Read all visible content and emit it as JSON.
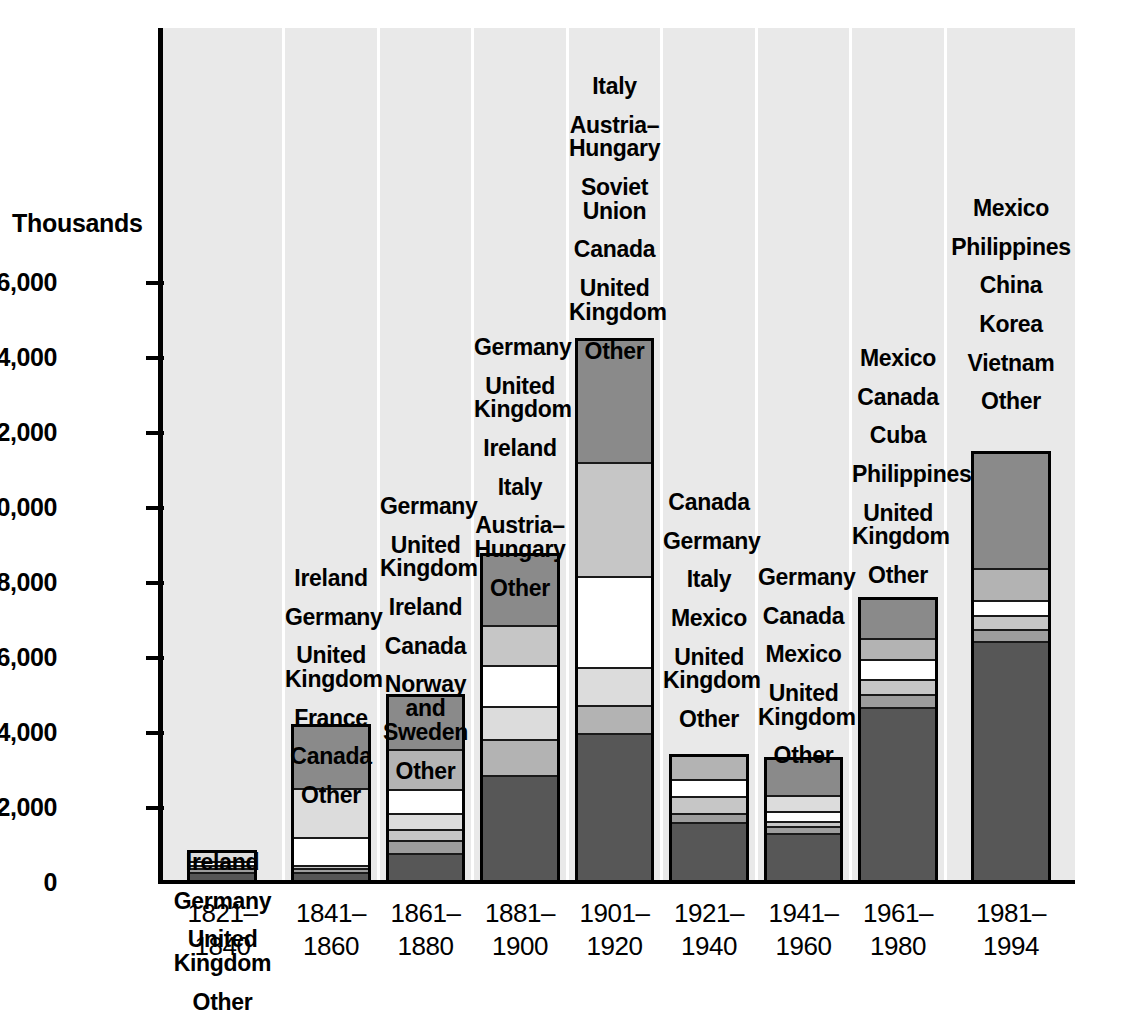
{
  "chart_data": {
    "type": "bar",
    "stacked": true,
    "title": "",
    "xlabel": "",
    "ylabel": "Thousands",
    "ylim": [
      0,
      17500
    ],
    "yticks": [
      0,
      2000,
      4000,
      6000,
      8000,
      10000,
      12000,
      14000,
      16000
    ],
    "ytick_labels": [
      "0",
      "2,000",
      "4,000",
      "6,000",
      "8,000",
      "10,000",
      "12,000",
      "14,000",
      "16,000"
    ],
    "grid": false,
    "legend": "in-panel stack labels above each bar",
    "categories": [
      "1821-\n1840",
      "1841-\n1860",
      "1861-\n1880",
      "1881-\n1900",
      "1901-\n1920",
      "1921-\n1940",
      "1941-\n1960",
      "1961-\n1980",
      "1981-\n1994"
    ],
    "bars": [
      {
        "period": "1821-1840",
        "total": 870,
        "labels": [
          "Ireland",
          "Germany",
          "United Kingdom",
          "Other"
        ],
        "segments": [
          {
            "name": "Other",
            "value": 300,
            "tone": "f-dark"
          },
          {
            "name": "United Kingdom",
            "value": 90,
            "tone": "f-mid"
          },
          {
            "name": "Germany",
            "value": 80,
            "tone": "f-light"
          },
          {
            "name": "Ireland",
            "value": 110,
            "tone": "f-white"
          },
          {
            "name": "Ireland-upper",
            "value": 290,
            "tone": "f-pale"
          }
        ]
      },
      {
        "period": "1841-1860",
        "total": 4240,
        "labels": [
          "Ireland",
          "Germany",
          "United Kingdom",
          "France",
          "Canada",
          "Other"
        ],
        "segments": [
          {
            "name": "Other",
            "value": 300,
            "tone": "f-dark"
          },
          {
            "name": "Canada",
            "value": 100,
            "tone": "f-mid"
          },
          {
            "name": "France",
            "value": 80,
            "tone": "f-light"
          },
          {
            "name": "United Kingdom",
            "value": 740,
            "tone": "f-white"
          },
          {
            "name": "Germany",
            "value": 1310,
            "tone": "f-pale"
          },
          {
            "name": "Ireland",
            "value": 1710,
            "tone": "f-gray"
          }
        ]
      },
      {
        "period": "1861-1880",
        "total": 5030,
        "labels": [
          "Germany",
          "United Kingdom",
          "Ireland",
          "Canada",
          "Norway and Sweden",
          "Other"
        ],
        "segments": [
          {
            "name": "Other",
            "value": 810,
            "tone": "f-dark"
          },
          {
            "name": "Norway and Sweden",
            "value": 350,
            "tone": "f-mid"
          },
          {
            "name": "Canada",
            "value": 280,
            "tone": "f-light"
          },
          {
            "name": "Ireland",
            "value": 440,
            "tone": "f-pale"
          },
          {
            "name": "United Kingdom",
            "value": 620,
            "tone": "f-white"
          },
          {
            "name": "Germany",
            "value": 1070,
            "tone": "f-lgray"
          },
          {
            "name": "Germany-upper",
            "value": 1460,
            "tone": "f-gray"
          }
        ]
      },
      {
        "period": "1881-1900",
        "total": 8790,
        "labels": [
          "Germany",
          "United Kingdom",
          "Ireland",
          "Italy",
          "Austria-Hungary",
          "Other"
        ],
        "segments": [
          {
            "name": "Other",
            "value": 2880,
            "tone": "f-dark"
          },
          {
            "name": "Austria-Hungary",
            "value": 950,
            "tone": "f-lgray"
          },
          {
            "name": "Italy",
            "value": 900,
            "tone": "f-pale"
          },
          {
            "name": "Ireland",
            "value": 1080,
            "tone": "f-white"
          },
          {
            "name": "United Kingdom",
            "value": 1080,
            "tone": "f-light"
          },
          {
            "name": "Germany",
            "value": 1900,
            "tone": "f-gray"
          }
        ]
      },
      {
        "period": "1901-1920",
        "total": 14530,
        "labels": [
          "Italy",
          "Austria-Hungary",
          "Soviet Union",
          "Canada",
          "United Kingdom",
          "Other"
        ],
        "segments": [
          {
            "name": "Other",
            "value": 3990,
            "tone": "f-dark"
          },
          {
            "name": "United Kingdom",
            "value": 760,
            "tone": "f-lgray"
          },
          {
            "name": "Canada",
            "value": 1000,
            "tone": "f-pale"
          },
          {
            "name": "Soviet Union",
            "value": 2430,
            "tone": "f-white"
          },
          {
            "name": "Austria-Hungary",
            "value": 3060,
            "tone": "f-light"
          },
          {
            "name": "Italy",
            "value": 3290,
            "tone": "f-gray"
          }
        ]
      },
      {
        "period": "1921-1940",
        "total": 3450,
        "labels": [
          "Canada",
          "Germany",
          "Italy",
          "Mexico",
          "United Kingdom",
          "Other"
        ],
        "segments": [
          {
            "name": "Other",
            "value": 1620,
            "tone": "f-dark"
          },
          {
            "name": "United Kingdom",
            "value": 240,
            "tone": "f-mid"
          },
          {
            "name": "Mexico",
            "value": 470,
            "tone": "f-light"
          },
          {
            "name": "Italy",
            "value": 440,
            "tone": "f-white"
          },
          {
            "name": "Germany",
            "value": 680,
            "tone": "f-lgray"
          }
        ]
      },
      {
        "period": "1941-1960",
        "total": 3360,
        "labels": [
          "Germany",
          "Canada",
          "Mexico",
          "United Kingdom",
          "Other"
        ],
        "segments": [
          {
            "name": "Other",
            "value": 1330,
            "tone": "f-dark"
          },
          {
            "name": "United Kingdom",
            "value": 200,
            "tone": "f-mid"
          },
          {
            "name": "Mexico",
            "value": 130,
            "tone": "f-light"
          },
          {
            "name": "Canada",
            "value": 270,
            "tone": "f-white"
          },
          {
            "name": "Germany-a",
            "value": 430,
            "tone": "f-pale"
          },
          {
            "name": "Germany",
            "value": 1000,
            "tone": "f-gray"
          }
        ]
      },
      {
        "period": "1961-1980",
        "total": 7620,
        "labels": [
          "Mexico",
          "Canada",
          "Cuba",
          "Philippines",
          "United Kingdom",
          "Other"
        ],
        "segments": [
          {
            "name": "Other",
            "value": 4700,
            "tone": "f-dark"
          },
          {
            "name": "United Kingdom",
            "value": 330,
            "tone": "f-mid"
          },
          {
            "name": "Philippines",
            "value": 410,
            "tone": "f-light"
          },
          {
            "name": "Cuba",
            "value": 530,
            "tone": "f-white"
          },
          {
            "name": "Canada",
            "value": 560,
            "tone": "f-lgray"
          },
          {
            "name": "Mexico",
            "value": 1090,
            "tone": "f-gray"
          }
        ]
      },
      {
        "period": "1981-1994",
        "total": 11520,
        "labels": [
          "Mexico",
          "Philippines",
          "China",
          "Korea",
          "Vietnam",
          "Other"
        ],
        "segments": [
          {
            "name": "Other",
            "value": 6450,
            "tone": "f-dark"
          },
          {
            "name": "Vietnam",
            "value": 320,
            "tone": "f-mid"
          },
          {
            "name": "Korea",
            "value": 380,
            "tone": "f-light"
          },
          {
            "name": "China",
            "value": 390,
            "tone": "f-white"
          },
          {
            "name": "Philippines",
            "value": 850,
            "tone": "f-lgray"
          },
          {
            "name": "Mexico",
            "value": 3130,
            "tone": "f-gray"
          }
        ]
      }
    ]
  },
  "axis": {
    "y_title": "Thousands",
    "ticks": [
      {
        "value": 16000,
        "label": "16,000"
      },
      {
        "value": 14000,
        "label": "14,000"
      },
      {
        "value": 12000,
        "label": "12,000"
      },
      {
        "value": 10000,
        "label": "10,000"
      },
      {
        "value": 8000,
        "label": "8,000"
      },
      {
        "value": 6000,
        "label": "6,000"
      },
      {
        "value": 4000,
        "label": "4,000"
      },
      {
        "value": 2000,
        "label": "2,000"
      },
      {
        "value": 0,
        "label": "0"
      }
    ]
  },
  "x_labels": [
    {
      "line1": "1821–",
      "line2": "1840"
    },
    {
      "line1": "1841–",
      "line2": "1860"
    },
    {
      "line1": "1861–",
      "line2": "1880"
    },
    {
      "line1": "1881–",
      "line2": "1900"
    },
    {
      "line1": "1901–",
      "line2": "1920"
    },
    {
      "line1": "1921–",
      "line2": "1940"
    },
    {
      "line1": "1941–",
      "line2": "1960"
    },
    {
      "line1": "1961–",
      "line2": "1980"
    },
    {
      "line1": "1981–",
      "line2": "1994"
    }
  ],
  "colors": {
    "panel_background": "#e9e9e9",
    "page_background": "#ffffff",
    "axis": "#000000",
    "segment_dark": "#575757",
    "segment_mid": "#9d9d9d",
    "segment_light": "#c6c6c6",
    "segment_pale": "#dcdcdc",
    "segment_white": "#ffffff",
    "segment_gray": "#8a8a8a",
    "segment_lgray": "#b3b3b3"
  }
}
